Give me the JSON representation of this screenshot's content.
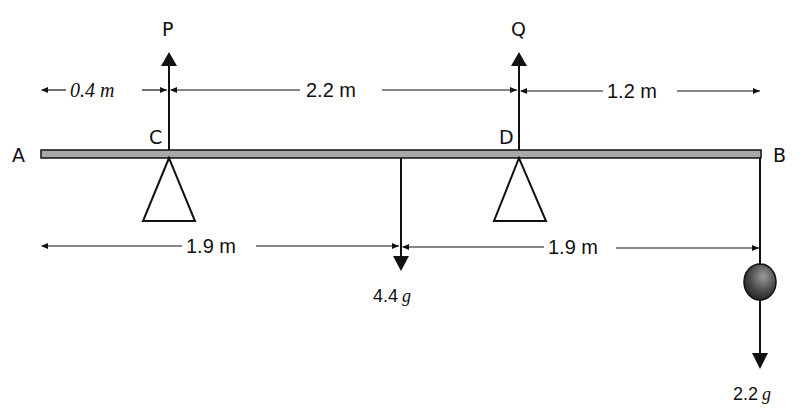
{
  "diagram": {
    "type": "beam-equilibrium",
    "beam": {
      "left_end": "A",
      "right_end": "B",
      "fill_color": "#a8a8a8"
    },
    "points": [
      {
        "label": "A",
        "role": "left end of beam"
      },
      {
        "label": "C",
        "role": "left support (triangle)"
      },
      {
        "label": "D",
        "role": "right support (triangle)"
      },
      {
        "label": "B",
        "role": "right end of beam"
      }
    ],
    "reactions": [
      {
        "label": "P",
        "at": "C",
        "direction": "up"
      },
      {
        "label": "Q",
        "at": "D",
        "direction": "up"
      }
    ],
    "loads": [
      {
        "value": "4.4",
        "unit": "g",
        "at": "midpoint",
        "direction": "down"
      },
      {
        "value": "2.2",
        "unit": "g",
        "at": "B",
        "direction": "down",
        "hanging_mass": true
      }
    ],
    "top_dimensions": [
      {
        "text": "0.4 m",
        "from": "A",
        "to": "C"
      },
      {
        "text": "2.2 m",
        "from": "C",
        "to": "D"
      },
      {
        "text": "1.2 m",
        "from": "D",
        "to": "B"
      }
    ],
    "bottom_dimensions": [
      {
        "text": "1.9 m",
        "from": "A",
        "to": "centre"
      },
      {
        "text": "1.9 m",
        "from": "centre",
        "to": "B"
      }
    ]
  },
  "labels": {
    "A": "A",
    "B": "B",
    "C": "C",
    "D": "D",
    "P": "P",
    "Q": "Q",
    "dim_AC": "0.4 m",
    "dim_CD": "2.2 m",
    "dim_DB": "1.2 m",
    "dim_A_mid": "1.9 m",
    "dim_mid_B": "1.9 m",
    "load_mid_value": "4.4",
    "load_mid_unit": "g",
    "load_B_value": "2.2",
    "load_B_unit": "g"
  }
}
